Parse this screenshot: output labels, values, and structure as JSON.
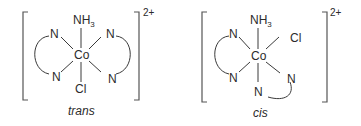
{
  "complexes": [
    {
      "caption": "trans",
      "charge": "2+",
      "center": "Co",
      "top": "NH",
      "top_sub": "3",
      "bottom": "Cl",
      "left_upper": "N",
      "left_lower": "N",
      "right_upper": "N",
      "right_lower": "N"
    },
    {
      "caption": "cis",
      "charge": "2+",
      "center": "Co",
      "top": "NH",
      "top_sub": "3",
      "right_upper": "Cl",
      "left_upper": "N",
      "left_lower": "N",
      "right_lower": "N",
      "bottom": "N"
    }
  ]
}
